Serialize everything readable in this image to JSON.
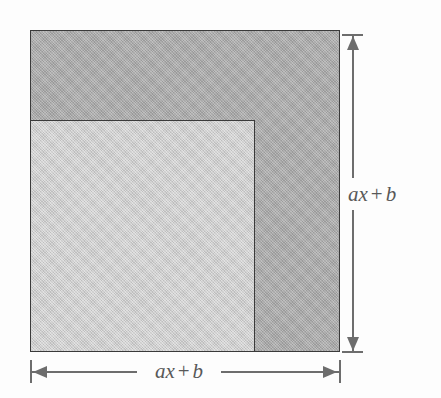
{
  "figure": {
    "type": "geometric-area-diagram",
    "background_color": "#fdfdfd",
    "outer_square": {
      "label": "outer-square",
      "fill_color": "#a9a9a9",
      "stroke_color": "#3a3a3a",
      "x": 30,
      "y": 30,
      "width": 310,
      "height": 322
    },
    "inner_square": {
      "label": "inner-square",
      "fill_color": "#cbcbcb",
      "stroke_color": "#3a3a3a",
      "x": 30,
      "y": 120,
      "width": 225,
      "height": 232
    },
    "dimensions": [
      {
        "name": "vertical-dimension",
        "orientation": "vertical",
        "position": "right",
        "label": {
          "full": "ax + b",
          "term1_var": "a",
          "term1_sub": "x",
          "operator": "+",
          "term2": "b"
        },
        "line_color": "#6d6d6d",
        "has_arrow_start": true,
        "has_arrow_end": true,
        "has_end_ticks": true
      },
      {
        "name": "horizontal-dimension",
        "orientation": "horizontal",
        "position": "bottom",
        "label": {
          "full": "ax + b",
          "term1_var": "a",
          "term1_sub": "x",
          "operator": "+",
          "term2": "b"
        },
        "line_color": "#6d6d6d",
        "has_arrow_start": true,
        "has_arrow_end": true,
        "has_end_ticks": true
      }
    ]
  }
}
